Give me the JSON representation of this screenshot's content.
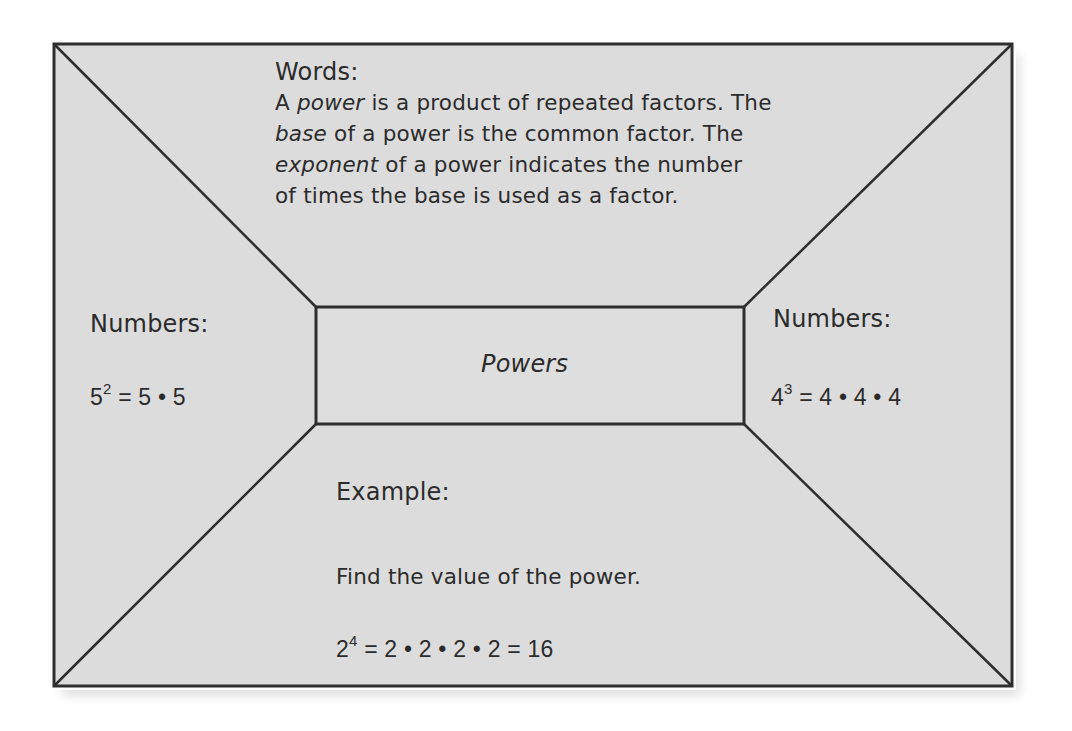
{
  "diagram": {
    "type": "four-square frayer model",
    "colors": {
      "background": "#dcdcdc",
      "line": "#2e2e2e",
      "text": "#2b2b2b",
      "page": "#ffffff"
    },
    "center": {
      "title": "Powers"
    },
    "top": {
      "heading": "Words:",
      "lines": [
        {
          "pre": "A ",
          "em": "power",
          "post": " is a product of repeated factors. The"
        },
        {
          "pre": "",
          "em": "base",
          "post": " of a power is the common factor. The"
        },
        {
          "pre": "",
          "em": "exponent",
          "post": " of a power indicates the number"
        },
        {
          "pre": "",
          "em": "",
          "post": "of times the base is used as a factor."
        }
      ]
    },
    "left": {
      "heading": "Numbers:",
      "equation": {
        "base": "5",
        "exponent": "2",
        "rest": " = 5 • 5"
      }
    },
    "right": {
      "heading": "Numbers:",
      "equation": {
        "base": "4",
        "exponent": "3",
        "rest": " = 4 • 4 • 4"
      }
    },
    "bottom": {
      "heading": "Example:",
      "prompt": "Find the value of the power.",
      "equation": {
        "base": "2",
        "exponent": "4",
        "rest": " = 2 • 2 • 2 • 2 = 16"
      }
    }
  }
}
